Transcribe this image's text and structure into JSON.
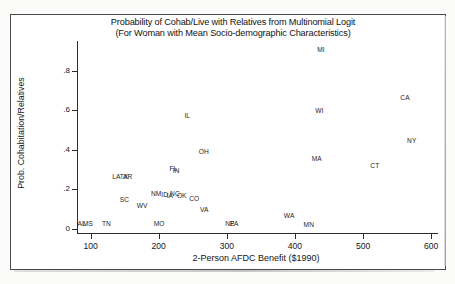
{
  "figure": {
    "title_line1": "Probability of Cohab/Live with Relatives from Multinomial Logit",
    "title_line2": "(For Woman with Mean Socio-demographic Characteristics)"
  },
  "axes": {
    "y_label": "Prob. Cohabitation/Relatives",
    "x_label": "2-Person AFDC Benefit ($1990)",
    "y_ticks": [
      "0",
      ".2",
      ".4",
      ".6",
      ".8"
    ],
    "x_ticks": [
      "100",
      "200",
      "300",
      "400",
      "500",
      "600"
    ]
  },
  "chart_data": {
    "type": "scatter",
    "title": "Probability of Cohab/Live with Relatives from Multinomial Logit (For Woman with Mean Socio-demographic Characteristics)",
    "xlabel": "2-Person AFDC Benefit ($1990)",
    "ylabel": "Prob. Cohabitation/Relatives",
    "xlim": [
      80,
      610
    ],
    "ylim": [
      -0.02,
      0.95
    ],
    "xticks": [
      100,
      200,
      300,
      400,
      500,
      600
    ],
    "yticks": [
      0,
      0.2,
      0.4,
      0.6,
      0.8
    ],
    "grid": false,
    "legend": "none",
    "marker_style": "state-abbreviation-text",
    "points": [
      {
        "label": "AL",
        "x": 88,
        "y": 0.025
      },
      {
        "label": "MS",
        "x": 96,
        "y": 0.025
      },
      {
        "label": "TN",
        "x": 124,
        "y": 0.025
      },
      {
        "label": "LA",
        "x": 139,
        "y": 0.265
      },
      {
        "label": "TX",
        "x": 150,
        "y": 0.265
      },
      {
        "label": "AR",
        "x": 155,
        "y": 0.265
      },
      {
        "label": "SC",
        "x": 150,
        "y": 0.145
      },
      {
        "label": "WV",
        "x": 175,
        "y": 0.115
      },
      {
        "label": "NM",
        "x": 196,
        "y": 0.175
      },
      {
        "label": "MO",
        "x": 200,
        "y": 0.025
      },
      {
        "label": "ID",
        "x": 211,
        "y": 0.17
      },
      {
        "label": "IA",
        "x": 219,
        "y": 0.168
      },
      {
        "label": "NC",
        "x": 224,
        "y": 0.175
      },
      {
        "label": "OK",
        "x": 234,
        "y": 0.168
      },
      {
        "label": "FL",
        "x": 223,
        "y": 0.305
      },
      {
        "label": "IN",
        "x": 228,
        "y": 0.295
      },
      {
        "label": "CO",
        "x": 252,
        "y": 0.15
      },
      {
        "label": "IL",
        "x": 245,
        "y": 0.57
      },
      {
        "label": "OH",
        "x": 266,
        "y": 0.39
      },
      {
        "label": "VA",
        "x": 268,
        "y": 0.095
      },
      {
        "label": "NE",
        "x": 305,
        "y": 0.025
      },
      {
        "label": "PA",
        "x": 312,
        "y": 0.025
      },
      {
        "label": "WA",
        "x": 391,
        "y": 0.065
      },
      {
        "label": "MN",
        "x": 420,
        "y": 0.02
      },
      {
        "label": "MI",
        "x": 440,
        "y": 0.905
      },
      {
        "label": "WI",
        "x": 437,
        "y": 0.595
      },
      {
        "label": "MA",
        "x": 432,
        "y": 0.355
      },
      {
        "label": "CT",
        "x": 518,
        "y": 0.32
      },
      {
        "label": "CA",
        "x": 562,
        "y": 0.66
      },
      {
        "label": "NY",
        "x": 572,
        "y": 0.445
      }
    ]
  }
}
